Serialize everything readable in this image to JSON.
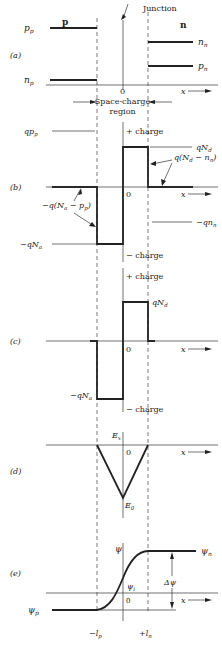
{
  "figure": {
    "junction_label": "Junction",
    "region_p": "p",
    "region_n": "n",
    "space_charge_label_line1": "Space-charge",
    "space_charge_label_line2": "region",
    "origin": "0",
    "x_axis": "x"
  },
  "panels": [
    {
      "id": "a",
      "label": "(a)",
      "curves": {
        "p_p": "p_p",
        "n_p": "n_p",
        "n_n": "n_n",
        "p_n": "p_n"
      }
    },
    {
      "id": "b",
      "label": "(b)",
      "annotations": {
        "q_pp": "qp_p",
        "plus_charge": "+ charge",
        "minus_charge": "− charge",
        "qNd": "qN_d",
        "q_Nd_minus_nn": "q(N_d − n_n)",
        "minus_q_Na_minus_pp": "−q(N_a − p_p)",
        "minus_qNa": "−qN_a",
        "minus_q_nn": "−qn_n"
      }
    },
    {
      "id": "c",
      "label": "(c)",
      "annotations": {
        "plus_charge": "+ charge",
        "minus_charge": "− charge",
        "qNd": "qN_d",
        "minus_qNa": "−qN_a"
      }
    },
    {
      "id": "d",
      "label": "(d)",
      "annotations": {
        "Ex": "E_x",
        "E0": "E_0"
      }
    },
    {
      "id": "e",
      "label": "(e)",
      "annotations": {
        "psi": "ψ",
        "psi_n": "ψ_n",
        "psi_p": "ψ_p",
        "psi_i": "ψ_i",
        "delta_psi": "Δψ",
        "minus_lp": "−l_p",
        "plus_ln": "+l_n"
      }
    }
  ],
  "text": {
    "junction": "Junction",
    "p": "p",
    "n": "n",
    "sc1": "Space-charge",
    "sc2": "region",
    "zero": "0",
    "x": "x",
    "a": "(a)",
    "b": "(b)",
    "c": "(c)",
    "d": "(d)",
    "e": "(e)",
    "pp_base": "p",
    "pp_sub": "p",
    "np_base": "n",
    "np_sub": "p",
    "nn_base": "n",
    "nn_sub": "n",
    "pn_base": "p",
    "pn_sub": "n",
    "qpp_base": "qp",
    "qpp_sub": "p",
    "plus_charge": "+ charge",
    "minus_charge": "− charge",
    "qNd_base": "qN",
    "qNd_sub": "d",
    "qNdnn_1": "q(N",
    "qNdnn_sub1": "d",
    "qNdnn_2": " − n",
    "qNdnn_sub2": "n",
    "qNdnn_3": ")",
    "qNapp_1": "−q(N",
    "qNapp_sub1": "a",
    "qNapp_2": " − p",
    "qNapp_sub2": "p",
    "qNapp_3": ")",
    "mqNa_base": "−qN",
    "mqNa_sub": "a",
    "mqnn_base": "−qn",
    "mqnn_sub": "n",
    "Ex_base": "E",
    "Ex_sub": "x",
    "E0_base": "E",
    "E0_sub": "0",
    "psi": "ψ",
    "psin_sub": "n",
    "psip_sub": "p",
    "psii_sub": "i",
    "dpsi": "Δψ",
    "mlp_base": "−l",
    "mlp_sub": "p",
    "pln_base": "+l",
    "pln_sub": "n"
  }
}
